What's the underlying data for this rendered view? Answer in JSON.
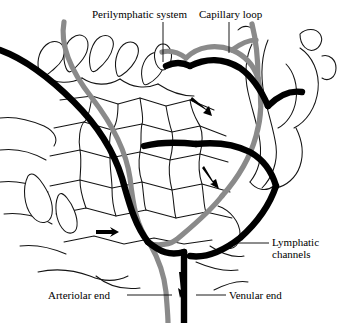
{
  "figure": {
    "background_color": "#ffffff",
    "width": 337,
    "height": 323
  },
  "palette": {
    "vein_black": "#000000",
    "artery_gray": "#8a8a8a",
    "lymph_outline": "#1a1a1a",
    "label_text": "#000000",
    "leader_line": "#000000"
  },
  "labels": {
    "perilymphatic_system": "Perilymphatic system",
    "capillary_loop": "Capillary loop",
    "lymphatic_channels_line1": "Lymphatic",
    "lymphatic_channels_line2": "channels",
    "arteriolar_end": "Arteriolar end",
    "venular_end": "Venular end"
  },
  "legend_semantics": {
    "black_vessel": "venule",
    "gray_vessel": "arteriole",
    "thin_outline": "lymphatic channel",
    "arrow": "flow direction"
  },
  "annotations": {
    "flow_arrows": [
      {
        "name": "flow-arrow-upper",
        "x": 205,
        "y": 112,
        "direction": "right-down"
      },
      {
        "name": "flow-arrow-middle",
        "x": 211,
        "y": 180,
        "direction": "down-right"
      },
      {
        "name": "flow-arrow-left",
        "x": 108,
        "y": 232,
        "direction": "right"
      },
      {
        "name": "flow-arrow-arteriolar",
        "x": 180,
        "y": 288,
        "direction": "down"
      }
    ]
  }
}
